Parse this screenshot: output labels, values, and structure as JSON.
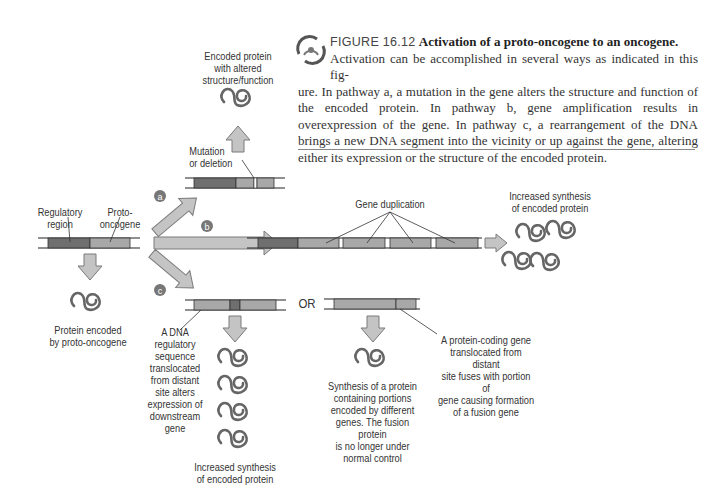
{
  "caption": {
    "figure_number": "FIGURE 16.12",
    "title": "Activation of a proto-oncogene to an oncogene.",
    "text_line1": "Activation can be accomplished in several ways as indicated in this fig-",
    "text_rest": "ure. In pathway a, a mutation in the gene alters the structure and function of the encoded protein. In pathway b, gene amplification results in overexpression of the gene. In pathway c, a rearrangement of the DNA brings a new DNA segment into the vicinity or up against the gene, altering either its expression or the structure of the encoded protein."
  },
  "diagram": {
    "origin": {
      "regulatory_label": [
        "Regulatory",
        "region"
      ],
      "proto_label": [
        "Proto-",
        "oncogene"
      ],
      "protein_label": [
        "Protein encoded",
        "by proto-oncogene"
      ]
    },
    "pathways": {
      "a": {
        "marker": "a",
        "mutation_label": [
          "Mutation",
          "or deletion"
        ],
        "result_label": [
          "Encoded protein",
          "with altered",
          "structure/function"
        ]
      },
      "b": {
        "marker": "b",
        "duplication_label": "Gene duplication",
        "result_label": [
          "Increased synthesis",
          "of encoded protein"
        ]
      },
      "c": {
        "marker": "c",
        "or_label": "OR",
        "left_annotation": [
          "A DNA",
          "regulatory",
          "sequence",
          "translocated",
          "from distant",
          "site alters",
          "expression of",
          "downstream gene"
        ],
        "left_result": [
          "Increased synthesis",
          "of encoded protein"
        ],
        "right_annotation": [
          "A protein-coding gene",
          "translocated from distant",
          "site fuses with portion of",
          "gene causing formation",
          "of a fusion gene"
        ],
        "right_result": [
          "Synthesis of a protein",
          "containing portions",
          "encoded by different",
          "genes. The fusion protein",
          "is no longer under",
          "normal control"
        ]
      }
    },
    "colors": {
      "regulatory": "#6f6f6f",
      "gene": "#a8a8a8",
      "arrow_fill": "#c4c4c4",
      "arrow_stroke": "#7a7a7a",
      "protein": "#666666",
      "marker": "#777777"
    }
  }
}
